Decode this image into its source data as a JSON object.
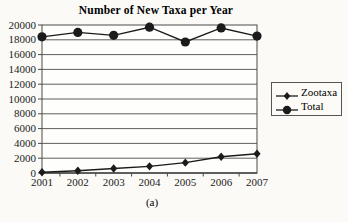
{
  "chart_data": {
    "type": "line",
    "title": "Number of New Taxa per Year",
    "caption": "(a)",
    "categories": [
      "2001",
      "2002",
      "2003",
      "2004",
      "2005",
      "2006",
      "2007"
    ],
    "series": [
      {
        "name": "Zootaxa",
        "marker": "diamond",
        "values": [
          100,
          300,
          600,
          900,
          1400,
          2200,
          2600
        ]
      },
      {
        "name": "Total",
        "marker": "circle",
        "values": [
          18400,
          19000,
          18600,
          19700,
          17700,
          19600,
          18500
        ]
      }
    ],
    "xlabel": "",
    "ylabel": "",
    "ylim": [
      0,
      20000
    ],
    "ytick_step": 2000,
    "grid": "horizontal",
    "legend_position": "right"
  },
  "colors": {
    "page_bg": "#fbfaf7",
    "plot_bg": "#fefefc",
    "legend_bg": "#fcfbf8",
    "series_color": "#1b1b1b",
    "grid_color": "#4d4d4d",
    "axis_color": "#4a4a4a",
    "text_color": "#1c1c1c"
  }
}
